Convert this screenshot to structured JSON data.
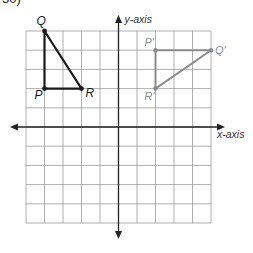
{
  "problem_number": "30)",
  "axes": {
    "x_label": "x-axis",
    "y_label": "y-axis",
    "x_range": [
      -6,
      5
    ],
    "y_range": [
      -5,
      5
    ],
    "grid_columns": 10,
    "grid_rows": 10
  },
  "colors": {
    "grid": "#9a9a9a",
    "axis": "#222222",
    "original": "#1a1a1a",
    "image": "#8c8c8c",
    "image_label": "#8c8c8c"
  },
  "triangle_original": {
    "name": "PQR",
    "vertices": [
      {
        "label": "Q",
        "x": -4,
        "y": 5
      },
      {
        "label": "P",
        "x": -4,
        "y": 2
      },
      {
        "label": "R",
        "x": -2,
        "y": 2
      }
    ]
  },
  "triangle_image": {
    "name": "P'Q'R'",
    "vertices": [
      {
        "label": "P'",
        "x": 2,
        "y": 4
      },
      {
        "label": "Q'",
        "x": 5,
        "y": 4
      },
      {
        "label": "R'",
        "x": 2,
        "y": 2
      }
    ]
  },
  "chart_data": {
    "type": "scatter",
    "title": "",
    "xlabel": "x-axis",
    "ylabel": "y-axis",
    "grid": true,
    "series": [
      {
        "name": "PQR",
        "points": [
          {
            "label": "Q",
            "x": -4,
            "y": 5
          },
          {
            "label": "P",
            "x": -4,
            "y": 2
          },
          {
            "label": "R",
            "x": -2,
            "y": 2
          }
        ],
        "closed": true
      },
      {
        "name": "P'Q'R'",
        "points": [
          {
            "label": "P'",
            "x": 2,
            "y": 4
          },
          {
            "label": "Q'",
            "x": 5,
            "y": 4
          },
          {
            "label": "R'",
            "x": 2,
            "y": 2
          }
        ],
        "closed": true
      }
    ]
  }
}
